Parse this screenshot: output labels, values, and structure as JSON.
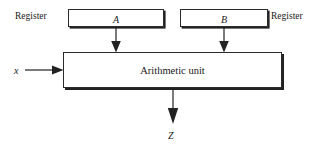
{
  "diagram": {
    "ink_color": "#222222",
    "background_color": "#ffffff",
    "registers": [
      {
        "id": "register-a",
        "box_text": "A",
        "side_label": "Register",
        "side_label_position": "left",
        "arrow_to": "arithmetic-unit"
      },
      {
        "id": "register-b",
        "box_text": "B",
        "side_label": "Register",
        "side_label_position": "right",
        "arrow_to": "arithmetic-unit"
      }
    ],
    "unit": {
      "id": "arithmetic-unit",
      "label": "Arithmetic unit"
    },
    "inputs": [
      {
        "id": "x-input",
        "label": "x",
        "direction": "right",
        "target": "arithmetic-unit"
      }
    ],
    "outputs": [
      {
        "id": "z-output",
        "label": "Z",
        "direction": "down",
        "source": "arithmetic-unit"
      }
    ]
  }
}
